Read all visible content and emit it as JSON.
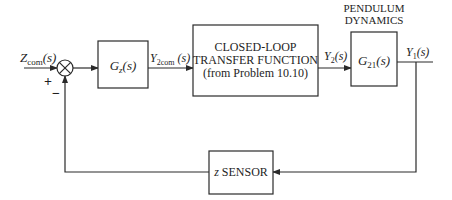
{
  "diagram": {
    "type": "control-block-diagram",
    "input": {
      "symbol": "Z",
      "subscript": "com",
      "arg": "(s)"
    },
    "summing_junction": {
      "plus_sign": "+",
      "minus_sign": "−"
    },
    "blocks": [
      {
        "id": "gz",
        "label_main": "G",
        "label_sub": "z",
        "label_arg": "(s)"
      },
      {
        "id": "closed_loop",
        "lines": [
          "CLOSED-LOOP",
          "TRANSFER FUNCTION",
          "(from Problem 10.10)"
        ]
      },
      {
        "id": "pendulum",
        "title_lines": [
          "PENDULUM",
          "DYNAMICS"
        ],
        "label_main": "G",
        "label_sub": "21",
        "label_arg": "(s)"
      },
      {
        "id": "sensor",
        "label_italic": "z",
        "label_text": " SENSOR"
      }
    ],
    "signals": {
      "y2com": {
        "symbol": "Y",
        "subscript": "2com",
        "arg": " (s)"
      },
      "y2": {
        "symbol": "Y",
        "subscript": "2",
        "arg": "(s)"
      },
      "y1": {
        "symbol": "Y",
        "subscript": "1",
        "arg": "(s)"
      }
    },
    "colors": {
      "line": "#2a2a2a",
      "text": "#1e1e1e",
      "background": "#ffffff"
    }
  }
}
